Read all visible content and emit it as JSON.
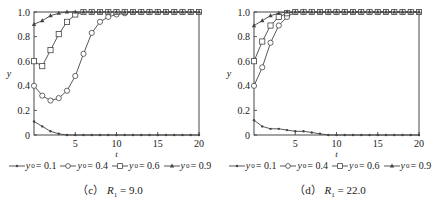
{
  "chart_data": [
    {
      "type": "line",
      "caption_prefix": "（c）",
      "caption_var": "R",
      "caption_sub": "1",
      "caption_value": "= 9.0",
      "xlabel": "t",
      "ylabel": "y",
      "xlim": [
        0,
        20
      ],
      "ylim": [
        0,
        1.0
      ],
      "xticks": [
        5,
        10,
        15,
        20
      ],
      "yticks": [
        0,
        0.2,
        0.4,
        0.6,
        0.8,
        1.0
      ],
      "grid": false,
      "legend_position": "bottom",
      "series": [
        {
          "name": "y0 = 0.1",
          "marker": "dot",
          "x": [
            0,
            1,
            2,
            3,
            4,
            5,
            6,
            7,
            8,
            9,
            10,
            11,
            12,
            13,
            14,
            15,
            16,
            17,
            18,
            19,
            20
          ],
          "y": [
            0.11,
            0.07,
            0.03,
            0.01,
            0.0,
            0.0,
            0.0,
            0.0,
            0.0,
            0.0,
            0.0,
            0.0,
            0.0,
            0.0,
            0.0,
            0.0,
            0.0,
            0.0,
            0.0,
            0.0,
            0.0
          ]
        },
        {
          "name": "y0 = 0.4",
          "marker": "circle",
          "x": [
            0,
            1,
            2,
            3,
            4,
            5,
            6,
            7,
            8,
            9,
            10,
            11,
            12,
            13,
            14,
            15,
            16,
            17,
            18,
            19,
            20
          ],
          "y": [
            0.4,
            0.32,
            0.28,
            0.3,
            0.36,
            0.48,
            0.66,
            0.83,
            0.92,
            0.96,
            0.98,
            0.99,
            1.0,
            1.0,
            1.0,
            1.0,
            1.0,
            1.0,
            1.0,
            1.0,
            1.0
          ]
        },
        {
          "name": "y0 = 0.6",
          "marker": "square",
          "x": [
            0,
            1,
            2,
            3,
            4,
            5,
            6,
            7,
            8,
            9,
            10,
            11,
            12,
            13,
            14,
            15,
            16,
            17,
            18,
            19,
            20
          ],
          "y": [
            0.6,
            0.56,
            0.69,
            0.82,
            0.92,
            0.98,
            1.0,
            1.0,
            1.0,
            1.0,
            1.0,
            1.0,
            1.0,
            1.0,
            1.0,
            1.0,
            1.0,
            1.0,
            1.0,
            1.0,
            1.0
          ]
        },
        {
          "name": "y0 = 0.9",
          "marker": "star",
          "x": [
            0,
            1,
            2,
            3,
            4,
            5,
            6,
            7,
            8,
            9,
            10,
            11,
            12,
            13,
            14,
            15,
            16,
            17,
            18,
            19,
            20
          ],
          "y": [
            0.9,
            0.93,
            0.97,
            0.99,
            1.0,
            1.0,
            1.0,
            1.0,
            1.0,
            1.0,
            1.0,
            1.0,
            1.0,
            1.0,
            1.0,
            1.0,
            1.0,
            1.0,
            1.0,
            1.0,
            1.0
          ]
        }
      ]
    },
    {
      "type": "line",
      "caption_prefix": "（d）",
      "caption_var": "R",
      "caption_sub": "1",
      "caption_value": "= 22.0",
      "xlabel": "t",
      "ylabel": "y",
      "xlim": [
        0,
        20
      ],
      "ylim": [
        0,
        1.0
      ],
      "xticks": [
        5,
        10,
        15,
        20
      ],
      "yticks": [
        0,
        0.2,
        0.4,
        0.6,
        0.8,
        1.0
      ],
      "grid": false,
      "legend_position": "bottom",
      "series": [
        {
          "name": "y0 = 0.1",
          "marker": "dot",
          "x": [
            0,
            1,
            2,
            3,
            4,
            5,
            6,
            7,
            8,
            9,
            10,
            11,
            12,
            13,
            14,
            15,
            16,
            17,
            18,
            19,
            20
          ],
          "y": [
            0.12,
            0.07,
            0.05,
            0.05,
            0.04,
            0.03,
            0.03,
            0.02,
            0.01,
            0.0,
            0.0,
            0.0,
            0.0,
            0.0,
            0.0,
            0.0,
            0.0,
            0.0,
            0.0,
            0.0,
            0.0
          ]
        },
        {
          "name": "y0 = 0.4",
          "marker": "circle",
          "x": [
            0,
            1,
            2,
            3,
            4,
            5,
            6,
            7,
            8,
            9,
            10,
            11,
            12,
            13,
            14,
            15,
            16,
            17,
            18,
            19,
            20
          ],
          "y": [
            0.4,
            0.55,
            0.75,
            0.89,
            0.96,
            1.0,
            1.0,
            1.0,
            1.0,
            1.0,
            1.0,
            1.0,
            1.0,
            1.0,
            1.0,
            1.0,
            1.0,
            1.0,
            1.0,
            1.0,
            1.0
          ]
        },
        {
          "name": "y0 = 0.6",
          "marker": "square",
          "x": [
            0,
            1,
            2,
            3,
            4,
            5,
            6,
            7,
            8,
            9,
            10,
            11,
            12,
            13,
            14,
            15,
            16,
            17,
            18,
            19,
            20
          ],
          "y": [
            0.6,
            0.76,
            0.89,
            0.96,
            0.99,
            1.0,
            1.0,
            1.0,
            1.0,
            1.0,
            1.0,
            1.0,
            1.0,
            1.0,
            1.0,
            1.0,
            1.0,
            1.0,
            1.0,
            1.0,
            1.0
          ]
        },
        {
          "name": "y0 = 0.9",
          "marker": "star",
          "x": [
            0,
            1,
            2,
            3,
            4,
            5,
            6,
            7,
            8,
            9,
            10,
            11,
            12,
            13,
            14,
            15,
            16,
            17,
            18,
            19,
            20
          ],
          "y": [
            0.89,
            0.93,
            0.97,
            0.99,
            1.0,
            1.0,
            1.0,
            1.0,
            1.0,
            1.0,
            1.0,
            1.0,
            1.0,
            1.0,
            1.0,
            1.0,
            1.0,
            1.0,
            1.0,
            1.0,
            1.0
          ]
        }
      ]
    }
  ],
  "legend": [
    {
      "var": "y",
      "sub": "0",
      "value": "= 0.1",
      "marker": "dot"
    },
    {
      "var": "y",
      "sub": "0",
      "value": "= 0.4",
      "marker": "circle"
    },
    {
      "var": "y",
      "sub": "0",
      "value": "= 0.6",
      "marker": "square"
    },
    {
      "var": "y",
      "sub": "0",
      "value": "= 0.9",
      "marker": "star"
    }
  ],
  "style": {
    "line_color": "#444444",
    "axis_color": "#333333",
    "marker_fill": "#ffffff"
  }
}
